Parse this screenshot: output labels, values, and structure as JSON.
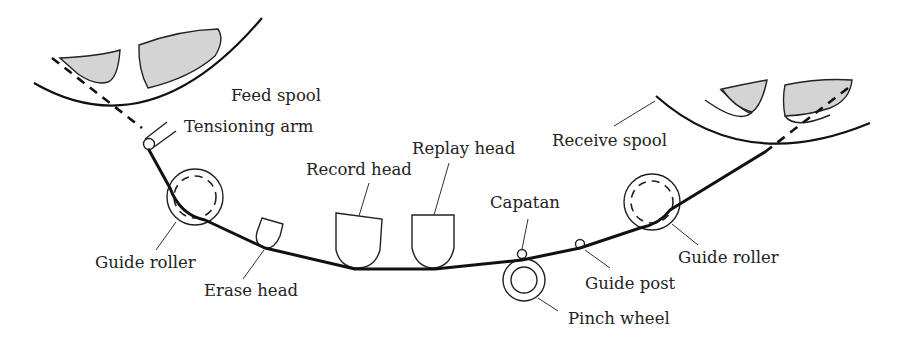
{
  "diagram": {
    "colors": {
      "line": "#111111",
      "tape_pack_fill": "#d4d4d4",
      "background": "#ffffff"
    },
    "labels": {
      "feed_spool": "Feed spool",
      "tensioning_arm": "Tensioning arm",
      "guide_roller_left": "Guide roller",
      "erase_head": "Erase head",
      "record_head": "Record head",
      "replay_head": "Replay head",
      "capstan": "Capatan",
      "pinch_wheel": "Pinch wheel",
      "guide_post": "Guide post",
      "guide_roller_right": "Guide roller",
      "receive_spool": "Receive spool"
    }
  }
}
